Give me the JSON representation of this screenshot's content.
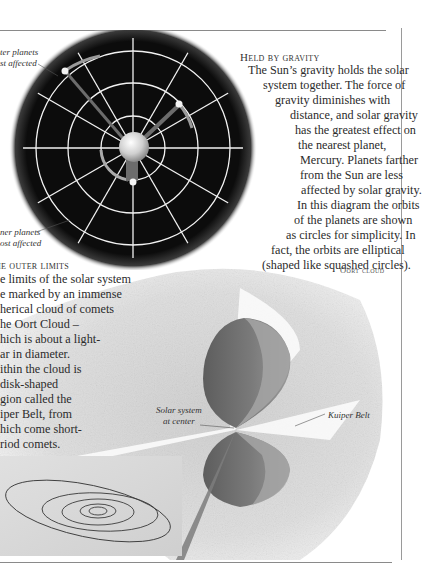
{
  "page": {
    "rules": [
      "top-rule",
      "right-rule",
      "bottom-rule"
    ]
  },
  "gravity_section": {
    "heading": "Held by gravity",
    "lines": [
      "The Sun’s gravity holds the solar",
      "system together. The force of",
      "gravity diminishes with",
      "distance, and solar gravity",
      "has the greatest effect on",
      "the nearest planet,",
      "Mercury. Planets farther",
      "from the Sun are less",
      "affected by solar gravity.",
      "In this diagram the orbits",
      "of the planets are shown",
      "as circles for simplicity. In",
      "fact, the orbits are elliptical",
      "(shaped like squashed circles)."
    ],
    "diagram": {
      "caption_top": [
        "ter planets",
        "st affected"
      ],
      "caption_bottom": [
        "ner planets",
        "ost affected"
      ],
      "colors": {
        "disc": "#0c0c0c",
        "grid": "#f4f4f4",
        "sun": "#d8d8d8",
        "arrow": "#7a7a7a"
      }
    }
  },
  "outer_limits_section": {
    "heading": "he outer limits",
    "lines": [
      "e limits of the solar system",
      "e marked by an immense",
      "herical cloud of comets",
      "he Oort Cloud –",
      "hich is about a light-",
      "ar in diameter.",
      "ithin the cloud is",
      "disk-shaped",
      "gion called the",
      "iper Belt, from",
      "hich come short-",
      "riod comets."
    ],
    "diagram": {
      "label_oort": "Oort cloud",
      "label_solar_system": [
        "Solar system",
        "at center"
      ],
      "label_kuiper": "Kuiper Belt",
      "colors": {
        "cloud": "#d9d9d9",
        "cone": "#6f6f6f",
        "inset": "#d4d4d4",
        "orbit": "#3a3a3a"
      }
    }
  }
}
